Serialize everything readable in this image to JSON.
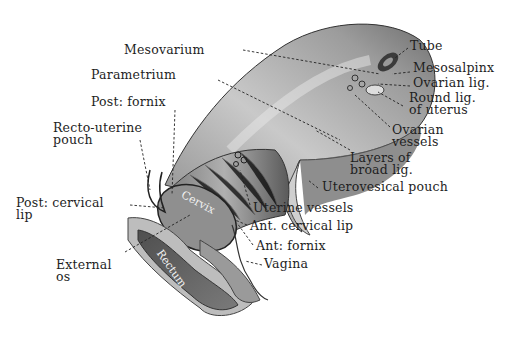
{
  "figure": {
    "labels": {
      "mesovarium": "Mesovarium",
      "parametrium": "Parametrium",
      "post_fornix": "Post: fornix",
      "recto_uterine_pouch_1": "Recto-uterine",
      "recto_uterine_pouch_2": "pouch",
      "post_cervical_lip_1": "Post: cervical",
      "post_cervical_lip_2": "lip",
      "external_os_1": "External",
      "external_os_2": "os",
      "tube": "Tube",
      "mesosalpinx": "Mesosalpinx",
      "ovarian_lig": "Ovarian lig.",
      "round_lig_1": "Round lig.",
      "round_lig_2": "of uterus",
      "ovarian_vessels_1": "Ovarian",
      "ovarian_vessels_2": "vessels",
      "layers_broad_lig_1": "Layers of",
      "layers_broad_lig_2": "broad lig.",
      "uterovesical_pouch": "Uterovesical pouch",
      "uterine_vessels": "Uterine vessels",
      "ant_cervical_lip": "Ant. cervical lip",
      "ant_fornix": "Ant: fornix",
      "vagina": "Vagina"
    },
    "inner_labels": {
      "cervix": "Cervix",
      "rectum": "Rectum"
    },
    "colors": {
      "ink": "#1e1e1e",
      "tissue_light": "#d6d6d6",
      "tissue_mid": "#9a9a9a",
      "tissue_dark": "#4a4a4a"
    }
  }
}
